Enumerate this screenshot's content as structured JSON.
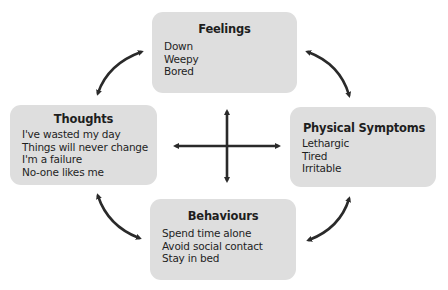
{
  "diagram": {
    "type": "cognitive-behavioural cycle",
    "colors": {
      "box_fill": "#dedede",
      "arrow": "#2a2a2a",
      "text": "#1e1e1e"
    },
    "boxes": {
      "feelings": {
        "title": "Feelings",
        "items": [
          "Down",
          "Weepy",
          "Bored"
        ]
      },
      "thoughts": {
        "title": "Thoughts",
        "items": [
          "I've wasted my day",
          "Things will never change",
          "I'm a failure",
          "No-one likes me"
        ]
      },
      "physical": {
        "title": "Physical Symptoms",
        "items": [
          "Lethargic",
          "Tired",
          "Irritable"
        ]
      },
      "behaviours": {
        "title": "Behaviours",
        "items": [
          "Spend time alone",
          "Avoid social contact",
          "Stay in bed"
        ]
      }
    },
    "connections": [
      {
        "from": "thoughts",
        "to": "feelings",
        "style": "curved double-headed arrow"
      },
      {
        "from": "feelings",
        "to": "physical",
        "style": "curved double-headed arrow"
      },
      {
        "from": "thoughts",
        "to": "behaviours",
        "style": "curved double-headed arrow"
      },
      {
        "from": "behaviours",
        "to": "physical",
        "style": "curved double-headed arrow"
      },
      {
        "from": "thoughts",
        "to": "physical",
        "style": "central cross double-headed arrow"
      },
      {
        "from": "feelings",
        "to": "behaviours",
        "style": "central cross double-headed arrow"
      }
    ]
  }
}
